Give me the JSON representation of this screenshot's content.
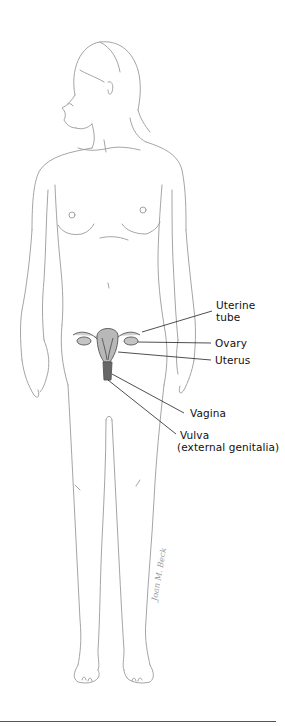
{
  "figure": {
    "labels": [
      {
        "id": "uterine-tube",
        "line1": "Uterine",
        "line2": "tube"
      },
      {
        "id": "ovary",
        "line1": "Ovary"
      },
      {
        "id": "uterus",
        "line1": "Uterus"
      },
      {
        "id": "vagina",
        "line1": "Vagina"
      },
      {
        "id": "vulva",
        "line1": "Vulva",
        "line2": "(external genitalia)"
      }
    ],
    "signature": "Joan M. Beck"
  },
  "colors": {
    "outline": "#9a9a9a",
    "organ_fill": "#b8b8b8",
    "organ_dark": "#555555",
    "leader_line": "#222222",
    "label_text": "#111111"
  }
}
